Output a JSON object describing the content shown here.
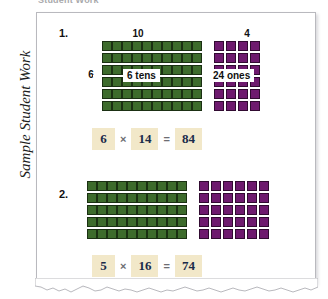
{
  "top_strip": {
    "ghost_text": "Student Work"
  },
  "side_label": {
    "text": "Sample Student Work"
  },
  "colors": {
    "tens_square": "#3d6b2c",
    "ones_square": "#6e1a6e",
    "equation_box_bg": "#f2e8c9",
    "equation_box_text": "#1a2b4a",
    "paper_bg": "#ffffff",
    "paper_border": "#b9b9be"
  },
  "problems": [
    {
      "number": "1.",
      "tens_col_label": "10",
      "ones_col_label": "4",
      "rows_label": "6",
      "tens_callout": "6 tens",
      "ones_callout": "24 ones",
      "rows": 6,
      "tens_cols": 10,
      "ones_cols": 4,
      "equation": {
        "factor1": "6",
        "operator": "×",
        "factor2": "14",
        "equals": "=",
        "product": "84"
      }
    },
    {
      "number": "2.",
      "tens_col_label": "",
      "ones_col_label": "",
      "rows_label": "",
      "tens_callout": "",
      "ones_callout": "",
      "rows": 5,
      "tens_cols": 10,
      "ones_cols": 6,
      "equation": {
        "factor1": "5",
        "operator": "×",
        "factor2": "16",
        "equals": "=",
        "product": "74"
      }
    }
  ]
}
